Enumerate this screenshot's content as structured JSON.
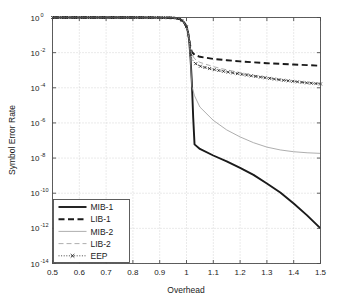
{
  "chart_data": {
    "type": "line",
    "title": "",
    "xlabel": "Overhead",
    "ylabel": "Symbol Error Rate",
    "xlim": [
      0.5,
      1.5
    ],
    "ylim": [
      1e-14,
      1.0
    ],
    "yscale": "log",
    "grid": true,
    "legend_position": "lower left",
    "xticks": [
      "0.5",
      "0.6",
      "0.7",
      "0.8",
      "0.9",
      "1",
      "1.1",
      "1.2",
      "1.3",
      "1.4",
      "1.5"
    ],
    "xtick_values": [
      0.5,
      0.6,
      0.7,
      0.8,
      0.9,
      1.0,
      1.1,
      1.2,
      1.3,
      1.4,
      1.5
    ],
    "yticks": [
      "10^0",
      "10^-2",
      "10^-4",
      "10^-6",
      "10^-8",
      "10^-10",
      "10^-12",
      "10^-14"
    ],
    "ytick_bases": [
      "10",
      "10",
      "10",
      "10",
      "10",
      "10",
      "10",
      "10"
    ],
    "ytick_exps": [
      "0",
      "-2",
      "-4",
      "-6",
      "-8",
      "-10",
      "-12",
      "-14"
    ],
    "ytick_values": [
      1.0,
      0.01,
      0.0001,
      1e-06,
      1e-08,
      1e-10,
      1e-12,
      1e-14
    ],
    "series": [
      {
        "name": "MIB-1",
        "style": "solid-thick",
        "color": "#1a1a1a",
        "x": [
          0.5,
          0.6,
          0.7,
          0.8,
          0.9,
          0.94,
          0.96,
          0.975,
          0.99,
          1.0,
          1.005,
          1.01,
          1.015,
          1.02,
          1.025,
          1.03,
          1.05,
          1.1,
          1.15,
          1.2,
          1.25,
          1.3,
          1.35,
          1.4,
          1.45,
          1.5
        ],
        "y": [
          1.0,
          1.0,
          1.0,
          1.0,
          0.99,
          0.97,
          0.93,
          0.82,
          0.55,
          0.3,
          0.16,
          0.05,
          0.005,
          0.0002,
          2e-06,
          6e-08,
          3.3e-08,
          1.4e-08,
          6.5e-09,
          2.8e-09,
          1.1e-09,
          3.6e-10,
          1.1e-10,
          2.6e-11,
          5.5e-12,
          1e-12
        ]
      },
      {
        "name": "LIB-1",
        "style": "dashed-thick",
        "color": "#1a1a1a",
        "x": [
          0.5,
          0.6,
          0.7,
          0.8,
          0.9,
          0.94,
          0.96,
          0.975,
          0.99,
          1.0,
          1.005,
          1.01,
          1.015,
          1.02,
          1.03,
          1.05,
          1.1,
          1.15,
          1.2,
          1.25,
          1.3,
          1.35,
          1.4,
          1.45,
          1.5
        ],
        "y": [
          1.0,
          1.0,
          1.0,
          1.0,
          0.99,
          0.97,
          0.93,
          0.82,
          0.55,
          0.3,
          0.16,
          0.06,
          0.02,
          0.011,
          0.0075,
          0.0058,
          0.0044,
          0.0037,
          0.0032,
          0.0028,
          0.0025,
          0.0023,
          0.0021,
          0.00195,
          0.0018
        ]
      },
      {
        "name": "MIB-2",
        "style": "solid-thin",
        "color": "#999999",
        "x": [
          0.5,
          0.6,
          0.7,
          0.8,
          0.9,
          0.94,
          0.96,
          0.975,
          0.99,
          1.0,
          1.005,
          1.01,
          1.015,
          1.02,
          1.03,
          1.05,
          1.1,
          1.15,
          1.2,
          1.25,
          1.3,
          1.35,
          1.4,
          1.45,
          1.5
        ],
        "y": [
          1.0,
          1.0,
          1.0,
          1.0,
          0.99,
          0.97,
          0.93,
          0.82,
          0.55,
          0.3,
          0.16,
          0.05,
          0.004,
          0.00012,
          3.5e-05,
          8e-06,
          1.4e-06,
          4e-07,
          1.6e-07,
          7.5e-08,
          4.2e-08,
          2.9e-08,
          2.3e-08,
          2e-08,
          1.85e-08
        ]
      },
      {
        "name": "LIB-2",
        "style": "dashed-thin",
        "color": "#999999",
        "x": [
          0.5,
          0.6,
          0.7,
          0.8,
          0.9,
          0.94,
          0.96,
          0.975,
          0.99,
          1.0,
          1.005,
          1.01,
          1.015,
          1.02,
          1.03,
          1.05,
          1.1,
          1.15,
          1.2,
          1.25,
          1.3,
          1.35,
          1.4,
          1.45,
          1.5
        ],
        "y": [
          1.0,
          1.0,
          1.0,
          1.0,
          0.99,
          0.97,
          0.93,
          0.82,
          0.55,
          0.3,
          0.16,
          0.06,
          0.018,
          0.008,
          0.0045,
          0.0028,
          0.0016,
          0.00105,
          0.00073,
          0.00052,
          0.00039,
          0.0003,
          0.00024,
          0.0002,
          0.000175
        ]
      },
      {
        "name": "EEP",
        "style": "dotted-marker",
        "color": "#1a1a1a",
        "marker": "x",
        "x": [
          0.5,
          0.6,
          0.7,
          0.8,
          0.9,
          0.94,
          0.96,
          0.975,
          0.99,
          1.0,
          1.005,
          1.01,
          1.015,
          1.02,
          1.03,
          1.05,
          1.1,
          1.15,
          1.2,
          1.25,
          1.3,
          1.35,
          1.4,
          1.45,
          1.5
        ],
        "y": [
          1.0,
          1.0,
          1.0,
          1.0,
          0.99,
          0.97,
          0.93,
          0.82,
          0.55,
          0.3,
          0.16,
          0.055,
          0.012,
          0.0045,
          0.0026,
          0.0017,
          0.0011,
          0.0008,
          0.0006,
          0.00046,
          0.00036,
          0.00028,
          0.00023,
          0.00019,
          0.000165
        ]
      }
    ],
    "legend": [
      {
        "label": "MIB-1",
        "style": "solid-thick",
        "color": "#1a1a1a"
      },
      {
        "label": "LIB-1",
        "style": "dashed-thick",
        "color": "#1a1a1a"
      },
      {
        "label": "MIB-2",
        "style": "solid-thin",
        "color": "#999999"
      },
      {
        "label": "LIB-2",
        "style": "dashed-thin",
        "color": "#999999"
      },
      {
        "label": "EEP",
        "style": "dotted-marker",
        "color": "#1a1a1a"
      }
    ]
  },
  "colors": {
    "axis": "#4d4d4d",
    "grid": "#b8b8b8",
    "text": "#1a1a1a",
    "background": "#ffffff",
    "dark_series": "#1a1a1a",
    "light_series": "#999999"
  }
}
